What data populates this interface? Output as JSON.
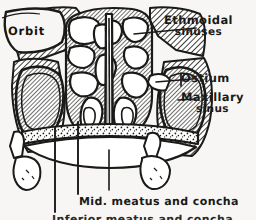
{
  "figure": {
    "kind": "anatomical-line-drawing",
    "background_color": "#f7f6f4",
    "ink_color": "#1a1a18",
    "width": 256,
    "height": 220
  },
  "labels": {
    "orbit": "Orbit",
    "ethmoidal_line1": "Ethmoidal",
    "ethmoidal_line2": "sinuses",
    "ostium": "Ostium",
    "maxillary_line1": "Maxillary",
    "maxillary_line2": "sinus",
    "mid_meatus": "Mid. meatus and concha",
    "bottom_cutoff": "Inferior meatus and concha"
  },
  "leaders": {
    "ethmoidal": "leader-line-ethmoidal",
    "ostium": "leader-line-ostium",
    "maxillary": "leader-line-maxillary",
    "mid_meatus_left": "leader-line-mid-meatus-left",
    "mid_meatus_right": "leader-line-mid-meatus-right",
    "bottom_left": "leader-line-bottom-left"
  },
  "structures": {
    "orbit": "orbit-cavity",
    "nasal_septum": "nasal-septum",
    "ethmoid_air_cells": "ethmoid-air-cell-group",
    "maxillary_sinus_left": "maxillary-sinus-left",
    "maxillary_sinus_right": "maxillary-sinus-right",
    "hard_palate": "hard-palate",
    "teeth_left": "molar-teeth-left",
    "teeth_right": "molar-teeth-right",
    "middle_concha_left": "middle-concha-left",
    "middle_concha_right": "middle-concha-right",
    "ostium_opening": "maxillary-ostium"
  }
}
